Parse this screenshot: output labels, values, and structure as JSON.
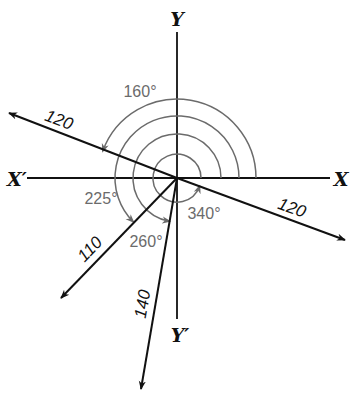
{
  "diagram": {
    "type": "vector-angle-diagram",
    "origin": {
      "x": 177,
      "y": 178
    },
    "colors": {
      "axis": "#111111",
      "vector": "#111111",
      "arc": "#6b6b6b",
      "angle_text": "#6b6b6b"
    },
    "axes": {
      "x_pos_label": "X",
      "x_neg_label": "X′",
      "y_pos_label": "Y",
      "y_neg_label": "Y′"
    },
    "vectors": [
      {
        "magnitude": "120",
        "angle_deg": 160,
        "angle_label": "160°"
      },
      {
        "magnitude": "120",
        "angle_deg": 340,
        "angle_label": "340°"
      },
      {
        "magnitude": "110",
        "angle_deg": 225,
        "angle_label": "225°"
      },
      {
        "magnitude": "140",
        "angle_deg": 260,
        "angle_label": "260°"
      }
    ]
  }
}
